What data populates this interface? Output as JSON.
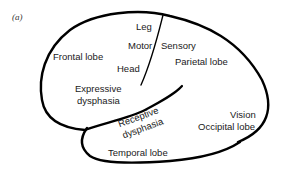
{
  "figure": {
    "panel_label": "(a)"
  },
  "labels": {
    "leg": "Leg",
    "motor": "Motor",
    "sensory": "Sensory",
    "head": "Head",
    "frontal_lobe": "Frontal lobe",
    "parietal_lobe": "Parietal lobe",
    "expressive_dysphasia_1": "Expressive",
    "expressive_dysphasia_2": "dysphasia",
    "receptive_dysphasia_1": "Receptive",
    "receptive_dysphasia_2": "dysphasia",
    "vision": "Vision",
    "occipital_lobe": "Occipital lobe",
    "temporal_lobe": "Temporal lobe"
  },
  "colors": {
    "outline": "#000000",
    "text": "#1a1a1a",
    "background": "#ffffff"
  }
}
